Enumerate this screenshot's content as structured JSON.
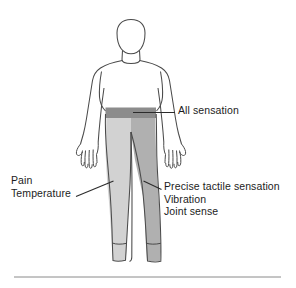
{
  "labels": {
    "all_sensation": "All sensation",
    "pain": "Pain",
    "temperature": "Temperature",
    "precise_tactile": "Precise tactile sensation",
    "vibration": "Vibration",
    "joint_sense": "Joint sense"
  },
  "regions": {
    "left_leg": {
      "name": "spinothalamic-loss-region",
      "shade_label": "light-grey",
      "color": "#d2d2d2",
      "modalities": [
        "Pain",
        "Temperature"
      ]
    },
    "right_leg": {
      "name": "dorsal-column-loss-region",
      "shade_label": "medium-grey",
      "color": "#b0b0b0",
      "modalities": [
        "Precise tactile sensation",
        "Vibration",
        "Joint sense"
      ]
    },
    "waist_band": {
      "name": "all-sensation-band",
      "shade_label": "dark-grey",
      "color": "#8c8c8c",
      "modalities": [
        "All sensation"
      ]
    },
    "upper_body": {
      "name": "unaffected-region",
      "shade_label": "white",
      "color": "#ffffff"
    }
  },
  "style": {
    "outline_color": "#4a4a4a",
    "leader_color": "#2b2b2b",
    "rule_color": "#8a8a8a",
    "text_color": "#1c1c1c",
    "background": "#ffffff"
  }
}
